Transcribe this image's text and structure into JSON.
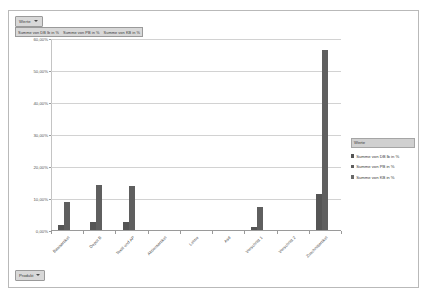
{
  "chart_object": {
    "value_filter_button": {
      "label": "Werte",
      "icon": "filter-dropdown-icon"
    },
    "category_filter_button": {
      "label": "Produkt",
      "icon": "filter-dropdown-icon"
    },
    "series_field_buttons": [
      "Summe von DB lb in %",
      "Summe von PB in %",
      "Summe von KB in %"
    ]
  },
  "legend": {
    "title": "Werte",
    "position": "right",
    "items": [
      {
        "label": "Summe von DB lb in %",
        "color": "#555555"
      },
      {
        "label": "Summe von PB in %",
        "color": "#5f5f5f"
      },
      {
        "label": "Summe von KB in %",
        "color": "#6a6a6a"
      }
    ]
  },
  "chart_data": {
    "type": "bar",
    "title": "",
    "xlabel": "",
    "ylabel": "",
    "ylim": [
      0,
      60
    ],
    "grid": true,
    "legend_position": "right",
    "ytick_labels": [
      "60,00%",
      "50,00%",
      "40,00%",
      "30,00%",
      "20,00%",
      "10,00%",
      "0,00%"
    ],
    "ytick_values": [
      60,
      50,
      40,
      30,
      20,
      10,
      0
    ],
    "categories": [
      "Basisartikel",
      "Depot B",
      "Textil und AP",
      "Aktionsartikel",
      "Leime",
      "Asd",
      "Verschnitt 1",
      "Verschnitt 2",
      "Zuschnittartikel"
    ],
    "series": [
      {
        "name": "Summe von DB lb in %",
        "color": "#555555",
        "values": [
          1.6,
          2.6,
          2.4,
          0,
          0,
          0,
          0.9,
          0,
          11.2
        ]
      },
      {
        "name": "Summe von PB in %",
        "color": "#5f5f5f",
        "values": [
          8.9,
          14.2,
          13.6,
          0,
          0,
          0,
          7.2,
          0,
          56.2
        ]
      },
      {
        "name": "Summe von KB in %",
        "color": "#6a6a6a",
        "values": [
          0,
          0,
          0,
          0,
          0,
          0,
          0,
          0,
          0
        ]
      }
    ]
  }
}
